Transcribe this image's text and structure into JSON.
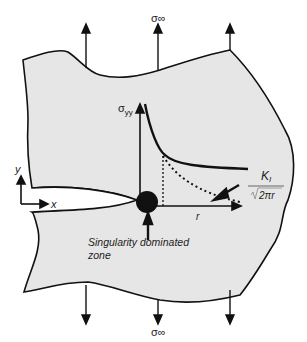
{
  "diagram": {
    "type": "crack-tip stress field schematic",
    "labels": {
      "sigma_top": "σ∞",
      "sigma_bottom": "σ∞",
      "sigma_yy": "σyy",
      "sigma_yy_main": "σ",
      "sigma_yy_sub": "yy",
      "axis_y": "y",
      "axis_x": "x",
      "axis_r": "r",
      "ki_numerator": "K",
      "ki_sub": "I",
      "ki_denominator": "2πr",
      "zone_line1": "Singularity dominated",
      "zone_line2": "zone"
    },
    "colors": {
      "body_fill": "#e6e6e6",
      "stroke": "#111111",
      "background": "#ffffff"
    }
  }
}
